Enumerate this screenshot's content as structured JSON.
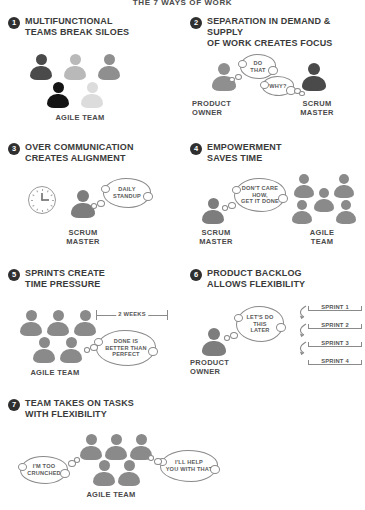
{
  "document": {
    "title": "THE 7 WAYS OF WORK"
  },
  "palette": {
    "ink": "#3a3a3a",
    "badge_bg": "#2f2f2f",
    "badge_text": "#ffffff",
    "person_dark": "#4a4a4a",
    "person_black": "#141414",
    "person_mid": "#7d7d7d",
    "person_light": "#b9b9b9",
    "person_xlight": "#dcdcdc",
    "outline": "#8a8a8a",
    "background": "#ffffff"
  },
  "sections": [
    {
      "number": "1",
      "title": "MULTIFUNCTIONAL TEAMS BREAK SILOES",
      "title_lines": [
        "MULTIFUNCTIONAL",
        "TEAMS BREAK SILOES"
      ],
      "caption": "AGILE TEAM",
      "people": [
        {
          "shade": "#4a4a4a"
        },
        {
          "shade": "#b9b9b9"
        },
        {
          "shade": "#8f8f8f"
        },
        {
          "shade": "#141414"
        },
        {
          "shade": "#dcdcdc"
        }
      ]
    },
    {
      "number": "2",
      "title": "SEPARATION IN DEMAND & SUPPLY OF WORK CREATES FOCUS",
      "title_lines": [
        "SEPARATION IN DEMAND & SUPPLY",
        "OF WORK CREATES FOCUS"
      ],
      "left_caption": "PRODUCT OWNER",
      "left_caption_lines": [
        "PRODUCT",
        "OWNER"
      ],
      "right_caption": "SCRUM MASTER",
      "right_caption_lines": [
        "SCRUM",
        "MASTER"
      ],
      "bubbles": [
        {
          "text": "DO THAT",
          "lines": [
            "DO",
            "THAT"
          ]
        },
        {
          "text": "WHY?",
          "lines": [
            "WHY?"
          ]
        }
      ]
    },
    {
      "number": "3",
      "title": "OVER COMMUNICATION CREATES ALIGNMENT",
      "title_lines": [
        "OVER COMMUNICATION",
        "CREATES ALIGNMENT"
      ],
      "caption": "SCRUM MASTER",
      "caption_lines": [
        "SCRUM",
        "MASTER"
      ],
      "icon": "clock-icon",
      "bubbles": [
        {
          "text": "DAILY STANDUP",
          "lines": [
            "DAILY",
            "STANDUP"
          ]
        }
      ]
    },
    {
      "number": "4",
      "title": "EMPOWERMENT SAVES TIME",
      "title_lines": [
        "EMPOWERMENT",
        "SAVES TIME"
      ],
      "left_caption": "SCRUM MASTER",
      "left_caption_lines": [
        "SCRUM",
        "MASTER"
      ],
      "right_caption": "AGILE TEAM",
      "right_caption_lines": [
        "AGILE",
        "TEAM"
      ],
      "bubbles": [
        {
          "text": "DON'T CARE HOW, GET IT DONE",
          "lines": [
            "DON'T CARE",
            "HOW,",
            "GET IT DONE"
          ]
        }
      ]
    },
    {
      "number": "5",
      "title": "SPRINTS CREATE TIME PRESSURE",
      "title_lines": [
        "SPRINTS CREATE",
        "TIME PRESSURE"
      ],
      "caption": "AGILE TEAM",
      "measure_label": "2 WEEKS",
      "bubbles": [
        {
          "text": "DONE IS BETTER THAN PERFECT",
          "lines": [
            "DONE IS",
            "BETTER THAN",
            "PERFECT"
          ]
        }
      ]
    },
    {
      "number": "6",
      "title": "PRODUCT BACKLOG ALLOWS FLEXIBILITY",
      "title_lines": [
        "PRODUCT BACKLOG",
        "ALLOWS FLEXIBILITY"
      ],
      "caption": "PRODUCT OWNER",
      "caption_lines": [
        "PRODUCT",
        "OWNER"
      ],
      "bubbles": [
        {
          "text": "LET'S DO THIS LATER",
          "lines": [
            "LET'S DO",
            "THIS",
            "LATER"
          ]
        }
      ],
      "sprints": [
        "SPRINT 1",
        "SPRINT 2",
        "SPRINT 3",
        "SPRINT 4"
      ]
    },
    {
      "number": "7",
      "title": "TEAM TAKES ON TASKS WITH FLEXIBILITY",
      "title_lines": [
        "TEAM TAKES ON TASKS",
        "WITH FLEXIBILITY"
      ],
      "caption": "AGILE TEAM",
      "bubbles": [
        {
          "text": "I'M TOO CRUNCHED",
          "lines": [
            "I'M TOO",
            "CRUNCHED"
          ]
        },
        {
          "text": "I'LL HELP YOU WITH THAT",
          "lines": [
            "I'LL HELP",
            "YOU WITH THAT"
          ]
        }
      ]
    }
  ]
}
